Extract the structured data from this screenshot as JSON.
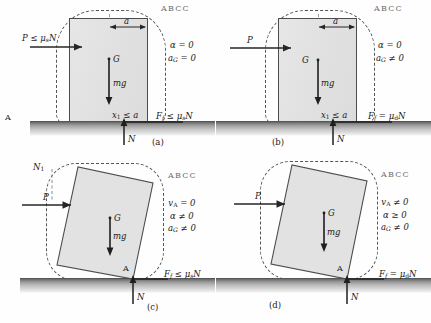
{
  "figure": {
    "watermark": "ABCC",
    "icons": {
      "arrow": "arrow-icon",
      "ground": "ground-hatch-icon",
      "fbd_outline": "free-body-outline-icon"
    },
    "colors": {
      "box_fill": "#e3e3e3",
      "box_stroke": "#4c4c4c",
      "ground": "#4a4a4a",
      "dashed": "#555555",
      "text": "#1b1b1b"
    }
  },
  "panels": [
    {
      "id": "a",
      "caption": "(a)",
      "applied_force": "P ≤ μ",
      "applied_force_sub": "s",
      "applied_force_tail": "N",
      "ground_point": "A",
      "dimension": "a",
      "center_label": "G",
      "weight_label": "mg",
      "offset_label": "x",
      "offset_label_sub": "1",
      "offset_label_tail": " ≤ a",
      "friction_label": "F",
      "friction_label_sub": "f",
      "friction_label_tail": " ≤ μ",
      "friction_label_sub2": "s",
      "friction_label_tail2": "N",
      "normal_label": "N",
      "states": [
        "α = 0",
        "a_G = 0"
      ],
      "state_rows": [
        {
          "sym": "α",
          "sub": "",
          "rel": " = 0"
        },
        {
          "sym": "a",
          "sub": "G",
          "rel": " = 0"
        }
      ]
    },
    {
      "id": "b",
      "caption": "(b)",
      "applied_force": "P",
      "applied_force_sub": "",
      "applied_force_tail": "",
      "ground_point": "",
      "dimension": "a",
      "center_label": "G",
      "weight_label": "mg",
      "offset_label": "x",
      "offset_label_sub": "1",
      "offset_label_tail": " ≤ a",
      "friction_label": "F",
      "friction_label_sub": "f",
      "friction_label_tail": " = μ",
      "friction_label_sub2": "d",
      "friction_label_tail2": "N",
      "normal_label": "N",
      "states": [
        "α = 0",
        "a_G ≠ 0"
      ],
      "state_rows": [
        {
          "sym": "α",
          "sub": "",
          "rel": " = 0"
        },
        {
          "sym": "a",
          "sub": "G",
          "rel": " ≠ 0"
        }
      ]
    },
    {
      "id": "c",
      "caption": "(c)",
      "applied_force": "P",
      "applied_force_sub": "",
      "applied_force_tail": "",
      "normal_guide_label": "N",
      "normal_guide_sub": "1",
      "center_label": "G",
      "weight_label": "mg",
      "contact_point": "A",
      "friction_label": "F",
      "friction_label_sub": "f",
      "friction_label_tail": " ≤ μ",
      "friction_label_sub2": "s",
      "friction_label_tail2": "N",
      "normal_label": "N",
      "states": [
        "v_A = 0",
        "α ≠ 0",
        "a_G ≠ 0"
      ],
      "state_rows": [
        {
          "sym": "v",
          "sub": "A",
          "rel": " = 0"
        },
        {
          "sym": "α",
          "sub": "",
          "rel": " ≠ 0"
        },
        {
          "sym": "a",
          "sub": "G",
          "rel": " ≠ 0"
        }
      ]
    },
    {
      "id": "d",
      "caption": "(d)",
      "applied_force": "P",
      "applied_force_sub": "",
      "applied_force_tail": "",
      "center_label": "G",
      "weight_label": "mg",
      "contact_point": "A",
      "friction_label": "F",
      "friction_label_sub": "f",
      "friction_label_tail": " = μ",
      "friction_label_sub2": "d",
      "friction_label_tail2": "N",
      "normal_label": "N",
      "states": [
        "v_A ≠ 0",
        "α ≥ 0",
        "a_G ≠ 0"
      ],
      "state_rows": [
        {
          "sym": "v",
          "sub": "A",
          "rel": " ≠ 0"
        },
        {
          "sym": "α",
          "sub": "",
          "rel": " ≥ 0"
        },
        {
          "sym": "a",
          "sub": "G",
          "rel": " ≠ 0"
        }
      ]
    }
  ]
}
